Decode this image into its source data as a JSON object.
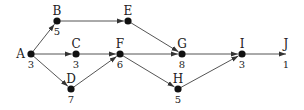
{
  "diagram": {
    "type": "activity-network",
    "colors": {
      "edge": "#555555",
      "node": "#111111",
      "text": "#222222"
    },
    "nodes": [
      {
        "id": "A",
        "label": "A",
        "weight": "3",
        "x": 31,
        "y": 54
      },
      {
        "id": "B",
        "label": "B",
        "weight": "5",
        "x": 57,
        "y": 21
      },
      {
        "id": "C",
        "label": "C",
        "weight": "3",
        "x": 76,
        "y": 54
      },
      {
        "id": "D",
        "label": "D",
        "weight": "7",
        "x": 71,
        "y": 89
      },
      {
        "id": "E",
        "label": "E",
        "weight": "",
        "x": 128,
        "y": 21
      },
      {
        "id": "F",
        "label": "F",
        "weight": "6",
        "x": 120,
        "y": 54
      },
      {
        "id": "G",
        "label": "G",
        "weight": "8",
        "x": 182,
        "y": 54
      },
      {
        "id": "H",
        "label": "H",
        "weight": "5",
        "x": 178,
        "y": 89
      },
      {
        "id": "I",
        "label": "I",
        "weight": "3",
        "x": 242,
        "y": 54
      },
      {
        "id": "J",
        "label": "J",
        "weight": "1",
        "x": 286,
        "y": 54
      }
    ],
    "edges": [
      {
        "from": "A",
        "to": "B"
      },
      {
        "from": "A",
        "to": "C"
      },
      {
        "from": "A",
        "to": "D"
      },
      {
        "from": "B",
        "to": "E"
      },
      {
        "from": "C",
        "to": "F"
      },
      {
        "from": "D",
        "to": "F"
      },
      {
        "from": "E",
        "to": "G"
      },
      {
        "from": "F",
        "to": "G"
      },
      {
        "from": "F",
        "to": "H"
      },
      {
        "from": "G",
        "to": "I"
      },
      {
        "from": "H",
        "to": "I"
      },
      {
        "from": "I",
        "to": "J"
      }
    ]
  }
}
